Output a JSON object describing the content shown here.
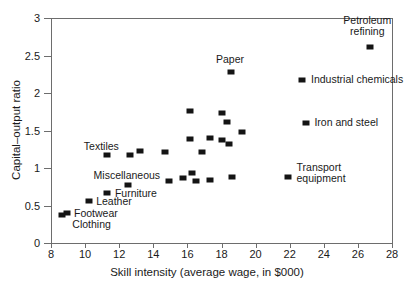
{
  "chart_data": {
    "type": "scatter",
    "title": "",
    "xlabel": "Skill intensity (average wage, in $000)",
    "ylabel": "Capital–output ratio",
    "xlim": [
      8,
      28
    ],
    "ylim": [
      0,
      3
    ],
    "xticks": [
      "8",
      "10",
      "12",
      "14",
      "16",
      "18",
      "20",
      "22",
      "24",
      "26",
      "28"
    ],
    "yticks": [
      "0",
      "0.5",
      "1",
      "1.5",
      "2",
      "2.5",
      "3"
    ],
    "grid": false,
    "legend": "none",
    "marker_color": "#141414",
    "axis_color": "#6d6d6d",
    "points": [
      {
        "x": 8.65,
        "y": 0.375,
        "label": "Clothing"
      },
      {
        "x": 8.95,
        "y": 0.405,
        "label": "Footwear"
      },
      {
        "x": 10.2,
        "y": 0.565,
        "label": "Leather"
      },
      {
        "x": 11.3,
        "y": 0.665,
        "label": "Furniture"
      },
      {
        "x": 11.3,
        "y": 1.17,
        "label": "Textiles"
      },
      {
        "x": 12.5,
        "y": 0.78,
        "label": "Miscellaneous"
      },
      {
        "x": 12.65,
        "y": 1.18,
        "label": ""
      },
      {
        "x": 13.2,
        "y": 1.23,
        "label": ""
      },
      {
        "x": 14.7,
        "y": 1.215,
        "label": ""
      },
      {
        "x": 14.95,
        "y": 0.825,
        "label": ""
      },
      {
        "x": 15.75,
        "y": 0.87,
        "label": ""
      },
      {
        "x": 16.15,
        "y": 1.765,
        "label": ""
      },
      {
        "x": 16.15,
        "y": 1.385,
        "label": ""
      },
      {
        "x": 16.25,
        "y": 0.94,
        "label": ""
      },
      {
        "x": 16.5,
        "y": 0.825,
        "label": ""
      },
      {
        "x": 16.85,
        "y": 1.215,
        "label": ""
      },
      {
        "x": 17.3,
        "y": 1.4,
        "label": ""
      },
      {
        "x": 17.35,
        "y": 0.835,
        "label": ""
      },
      {
        "x": 18.05,
        "y": 1.74,
        "label": ""
      },
      {
        "x": 18.05,
        "y": 1.375,
        "label": ""
      },
      {
        "x": 18.35,
        "y": 1.615,
        "label": ""
      },
      {
        "x": 18.45,
        "y": 1.32,
        "label": ""
      },
      {
        "x": 18.55,
        "y": 2.275,
        "label": "Paper"
      },
      {
        "x": 18.6,
        "y": 0.875,
        "label": ""
      },
      {
        "x": 19.2,
        "y": 1.485,
        "label": ""
      },
      {
        "x": 21.9,
        "y": 0.875,
        "label": "Transport equipment"
      },
      {
        "x": 22.75,
        "y": 2.18,
        "label": "Industrial chemicals"
      },
      {
        "x": 22.95,
        "y": 1.6,
        "label": "Iron and steel"
      },
      {
        "x": 26.7,
        "y": 2.61,
        "label": "Petroleum refining"
      }
    ],
    "annotations": [
      {
        "text": "Petroleum\nrefining",
        "x": 26.55,
        "y": 2.9,
        "align": "center"
      },
      {
        "text": "Industrial chemicals",
        "x": 23.25,
        "y": 2.19,
        "align": "left"
      },
      {
        "text": "Iron and steel",
        "x": 23.45,
        "y": 1.61,
        "align": "left"
      },
      {
        "text": "Transport\nequipment",
        "x": 22.4,
        "y": 0.93,
        "align": "left"
      },
      {
        "text": "Paper",
        "x": 18.5,
        "y": 2.46,
        "align": "center"
      },
      {
        "text": "Textiles",
        "x": 10.95,
        "y": 1.29,
        "align": "center"
      },
      {
        "text": "Miscellaneous",
        "x": 12.45,
        "y": 0.905,
        "align": "center"
      },
      {
        "text": "Furniture",
        "x": 11.75,
        "y": 0.665,
        "align": "left"
      },
      {
        "text": "Leather",
        "x": 10.65,
        "y": 0.565,
        "align": "left"
      },
      {
        "text": "Footwear",
        "x": 9.35,
        "y": 0.405,
        "align": "left"
      },
      {
        "text": "Clothing",
        "x": 9.25,
        "y": 0.255,
        "align": "left"
      }
    ]
  }
}
